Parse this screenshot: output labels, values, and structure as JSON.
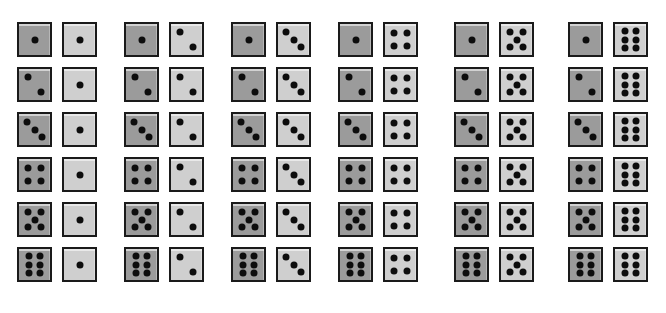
{
  "figure": {
    "kind": "dice-sample-space-grid",
    "rows": 6,
    "columns": 6,
    "total_pairs": 36,
    "left_die_color": "#9b9b9b",
    "right_die_color": "#cfcfcf",
    "pip_color": "#0d0d0d",
    "border_color": "#1a1a1a",
    "background_color": "#ffffff"
  },
  "pip_layouts": {
    "1": [
      [
        50,
        50
      ]
    ],
    "2": [
      [
        29,
        26
      ],
      [
        71,
        74
      ]
    ],
    "3": [
      [
        27,
        25
      ],
      [
        50,
        50
      ],
      [
        73,
        75
      ]
    ],
    "4": [
      [
        30,
        28
      ],
      [
        70,
        28
      ],
      [
        30,
        72
      ],
      [
        70,
        72
      ]
    ],
    "5": [
      [
        28,
        26
      ],
      [
        72,
        26
      ],
      [
        50,
        50
      ],
      [
        28,
        74
      ],
      [
        72,
        74
      ]
    ],
    "6": [
      [
        31,
        24
      ],
      [
        69,
        24
      ],
      [
        31,
        50
      ],
      [
        69,
        50
      ],
      [
        31,
        76
      ],
      [
        69,
        76
      ]
    ]
  },
  "grid": [
    {
      "row": 1,
      "pairs": [
        {
          "left": 1,
          "right": 1
        },
        {
          "left": 1,
          "right": 2
        },
        {
          "left": 1,
          "right": 3
        },
        {
          "left": 1,
          "right": 4
        },
        {
          "left": 1,
          "right": 5
        },
        {
          "left": 1,
          "right": 6
        }
      ]
    },
    {
      "row": 2,
      "pairs": [
        {
          "left": 2,
          "right": 1
        },
        {
          "left": 2,
          "right": 2
        },
        {
          "left": 2,
          "right": 3
        },
        {
          "left": 2,
          "right": 4
        },
        {
          "left": 2,
          "right": 5
        },
        {
          "left": 2,
          "right": 6
        }
      ]
    },
    {
      "row": 3,
      "pairs": [
        {
          "left": 3,
          "right": 1
        },
        {
          "left": 3,
          "right": 2
        },
        {
          "left": 3,
          "right": 3
        },
        {
          "left": 3,
          "right": 4
        },
        {
          "left": 3,
          "right": 5
        },
        {
          "left": 3,
          "right": 6
        }
      ]
    },
    {
      "row": 4,
      "pairs": [
        {
          "left": 4,
          "right": 1
        },
        {
          "left": 4,
          "right": 2
        },
        {
          "left": 4,
          "right": 3
        },
        {
          "left": 4,
          "right": 4
        },
        {
          "left": 4,
          "right": 5
        },
        {
          "left": 4,
          "right": 6
        }
      ]
    },
    {
      "row": 5,
      "pairs": [
        {
          "left": 5,
          "right": 1
        },
        {
          "left": 5,
          "right": 2
        },
        {
          "left": 5,
          "right": 3
        },
        {
          "left": 5,
          "right": 4
        },
        {
          "left": 5,
          "right": 5
        },
        {
          "left": 5,
          "right": 6
        }
      ]
    },
    {
      "row": 6,
      "pairs": [
        {
          "left": 6,
          "right": 1
        },
        {
          "left": 6,
          "right": 2
        },
        {
          "left": 6,
          "right": 3
        },
        {
          "left": 6,
          "right": 4
        },
        {
          "left": 6,
          "right": 5
        },
        {
          "left": 6,
          "right": 6
        }
      ]
    }
  ],
  "layout": {
    "row_tops": [
      22,
      67,
      112,
      157,
      202,
      247
    ],
    "group_lefts": [
      17,
      124,
      231,
      338,
      454,
      568
    ],
    "die_size": 31,
    "die_border": 2,
    "right_die_offset": 45
  }
}
